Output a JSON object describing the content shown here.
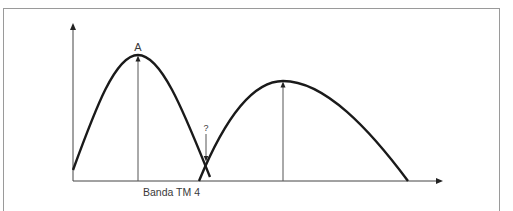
{
  "diagram": {
    "peak_label": "A",
    "question_label": "?",
    "x_label": "Banda TM 4",
    "colors": {
      "curve": "#1a1a1a",
      "axis": "#444444",
      "arrow": "#555555",
      "frame": "#9a9a9a",
      "text": "#3a3a3a"
    },
    "curves": [
      {
        "name": "curve-1",
        "start": [
          73,
          170
        ],
        "peak": [
          138,
          55
        ],
        "end": [
          210,
          177
        ]
      },
      {
        "name": "curve-2",
        "start": [
          199,
          181
        ],
        "peak": [
          283,
          81
        ],
        "end": [
          408,
          181
        ]
      }
    ]
  }
}
